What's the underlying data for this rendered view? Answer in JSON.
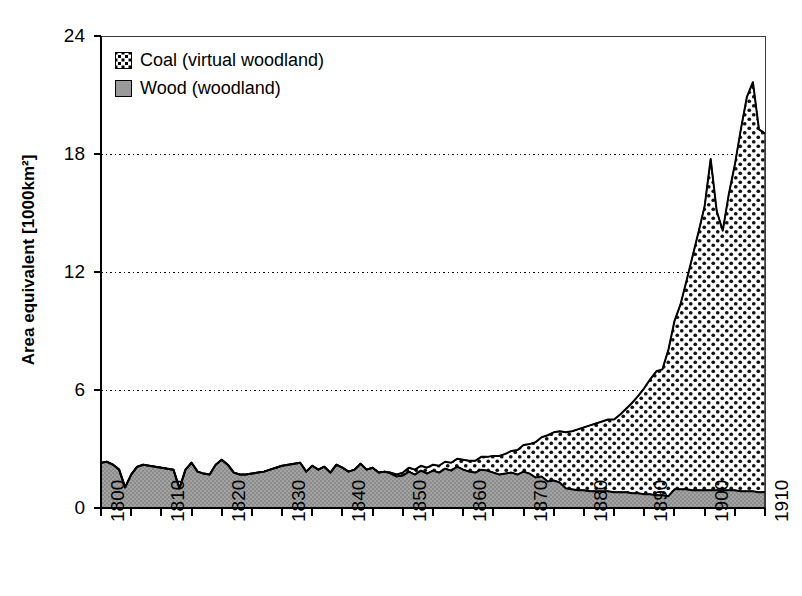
{
  "chart_data": {
    "type": "area",
    "stacked": true,
    "title": "",
    "xlabel": "",
    "ylabel": "Area equivalent [1000km²]",
    "xlim": [
      1800,
      1910
    ],
    "ylim": [
      0,
      24
    ],
    "yticks": [
      0,
      6,
      12,
      18,
      24
    ],
    "xticks": [
      1800,
      1810,
      1820,
      1830,
      1840,
      1850,
      1860,
      1870,
      1880,
      1890,
      1900,
      1910
    ],
    "xtick_labels": [
      "1800",
      "1810",
      "1820",
      "1830",
      "1840",
      "1850",
      "1860",
      "1870",
      "1880",
      "1890",
      "1900",
      "1910"
    ],
    "ytick_labels": [
      "0",
      "6",
      "12",
      "18",
      "24"
    ],
    "xtick_minor_step": 5,
    "grid": "horizontal-dotted",
    "legend_position": "top-left",
    "legend": [
      {
        "label": "Coal (virtual woodland)",
        "pattern": "crosshatch-dots",
        "fill": "#ffffff",
        "dot_color": "#000000"
      },
      {
        "label": "Wood (woodland)",
        "pattern": "solid",
        "fill": "#9a9a9a"
      }
    ],
    "x": [
      1800,
      1801,
      1802,
      1803,
      1804,
      1805,
      1806,
      1807,
      1808,
      1809,
      1810,
      1811,
      1812,
      1813,
      1814,
      1815,
      1816,
      1817,
      1818,
      1819,
      1820,
      1821,
      1822,
      1823,
      1824,
      1825,
      1826,
      1827,
      1828,
      1829,
      1830,
      1831,
      1832,
      1833,
      1834,
      1835,
      1836,
      1837,
      1838,
      1839,
      1840,
      1841,
      1842,
      1843,
      1844,
      1845,
      1846,
      1847,
      1848,
      1849,
      1850,
      1851,
      1852,
      1853,
      1854,
      1855,
      1856,
      1857,
      1858,
      1859,
      1860,
      1861,
      1862,
      1863,
      1864,
      1865,
      1866,
      1867,
      1868,
      1869,
      1870,
      1871,
      1872,
      1873,
      1874,
      1875,
      1876,
      1877,
      1878,
      1879,
      1880,
      1881,
      1882,
      1883,
      1884,
      1885,
      1886,
      1887,
      1888,
      1889,
      1890,
      1891,
      1892,
      1893,
      1894,
      1895,
      1896,
      1897,
      1898,
      1899,
      1900,
      1901,
      1902,
      1903,
      1904,
      1905,
      1906,
      1907,
      1908,
      1909,
      1910
    ],
    "series": [
      {
        "name": "Wood (woodland)",
        "values": [
          2.3,
          2.35,
          2.2,
          1.95,
          1.05,
          1.7,
          2.1,
          2.2,
          2.15,
          2.1,
          2.05,
          2.0,
          1.95,
          1.0,
          1.95,
          2.3,
          1.85,
          1.75,
          1.7,
          2.2,
          2.45,
          2.2,
          1.8,
          1.7,
          1.7,
          1.75,
          1.8,
          1.85,
          1.95,
          2.05,
          2.15,
          2.2,
          2.25,
          2.3,
          1.85,
          2.15,
          1.95,
          2.1,
          1.8,
          2.2,
          2.05,
          1.85,
          1.95,
          2.25,
          1.95,
          2.05,
          1.8,
          1.85,
          1.75,
          1.6,
          1.65,
          1.85,
          1.7,
          1.9,
          1.75,
          1.9,
          1.8,
          2.0,
          1.9,
          2.1,
          1.95,
          1.85,
          1.8,
          1.95,
          1.9,
          1.8,
          1.7,
          1.75,
          1.8,
          1.7,
          1.85,
          1.75,
          1.55,
          1.6,
          1.35,
          1.4,
          1.3,
          1.0,
          0.95,
          0.9,
          0.9,
          0.85,
          0.85,
          0.85,
          0.85,
          0.8,
          0.8,
          0.8,
          0.75,
          0.75,
          0.7,
          0.7,
          0.65,
          0.65,
          0.6,
          0.95,
          0.95,
          0.95,
          0.9,
          0.9,
          0.9,
          0.9,
          0.9,
          0.9,
          0.9,
          0.9,
          0.85,
          0.85,
          0.85,
          0.8,
          0.8
        ]
      },
      {
        "name": "Coal (virtual woodland)",
        "values": [
          0.0,
          0.0,
          0.0,
          0.0,
          0.0,
          0.0,
          0.0,
          0.0,
          0.0,
          0.0,
          0.0,
          0.0,
          0.0,
          0.0,
          0.0,
          0.0,
          0.0,
          0.0,
          0.0,
          0.0,
          0.0,
          0.0,
          0.0,
          0.0,
          0.0,
          0.0,
          0.0,
          0.0,
          0.0,
          0.0,
          0.0,
          0.0,
          0.0,
          0.0,
          0.0,
          0.0,
          0.0,
          0.0,
          0.0,
          0.0,
          0.0,
          0.0,
          0.0,
          0.0,
          0.0,
          0.0,
          0.0,
          0.0,
          0.05,
          0.1,
          0.15,
          0.2,
          0.25,
          0.25,
          0.3,
          0.3,
          0.35,
          0.35,
          0.4,
          0.4,
          0.5,
          0.55,
          0.6,
          0.65,
          0.7,
          0.85,
          0.95,
          1.0,
          1.1,
          1.25,
          1.35,
          1.5,
          1.8,
          2.0,
          2.35,
          2.45,
          2.6,
          2.85,
          2.95,
          3.1,
          3.2,
          3.35,
          3.45,
          3.55,
          3.65,
          3.7,
          3.95,
          4.25,
          4.6,
          4.95,
          5.4,
          5.85,
          6.3,
          6.4,
          7.45,
          8.55,
          9.4,
          10.6,
          11.9,
          13.15,
          14.45,
          16.85,
          14.2,
          13.2,
          15.05,
          16.55,
          18.4,
          20.05,
          20.8,
          18.45,
          18.25
        ]
      }
    ],
    "totals_note": {
      "peak_total": 21.6,
      "peak_year": 1908,
      "end_total": 19.05,
      "end_year": 1910
    }
  }
}
